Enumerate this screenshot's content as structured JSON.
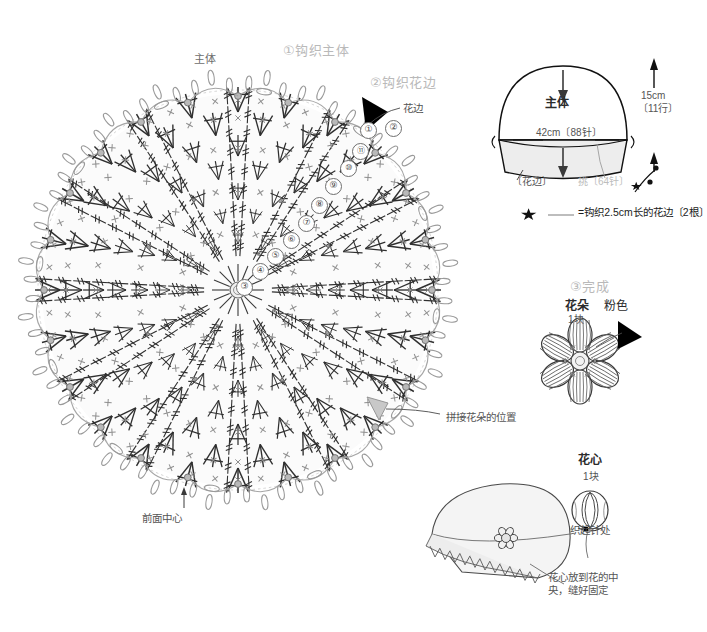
{
  "page": {
    "bg": "#ffffff"
  },
  "steps": {
    "step1": "①钩织主体",
    "step2": "②钩织花边",
    "step3": "③完成"
  },
  "main_chart": {
    "body_label": "主体",
    "lace_label": "花边",
    "front_center_label": "前面中心",
    "flower_position_label": "拼接花朵的位置",
    "round_numbers": [
      "①",
      "②",
      "⑪",
      "⑩",
      "⑨",
      "⑧",
      "⑦",
      "⑥",
      "⑤",
      "④",
      "③"
    ]
  },
  "schematic": {
    "body_label": "主体",
    "width_label": "42cm〔88针〕",
    "height_label": "15cm",
    "rows_label": "〔11行〕",
    "lace_label": "〔花边〕",
    "pickup_label": "挑〔64针〕"
  },
  "legend": {
    "star": "★",
    "text": "=钩织2.5cm长的花边〔2根〕"
  },
  "flower": {
    "name": "花朵",
    "color": "粉色",
    "count": "1块"
  },
  "flower_center": {
    "name": "花心",
    "count": "1块",
    "start_label": "编织起针处"
  },
  "finish": {
    "note_line1": "花心放到花的中",
    "note_line2": "央，缝好固定"
  },
  "colors": {
    "ink": "#3a3a3a",
    "faint": "#bdbdbd",
    "fill": "#f4f4f4",
    "accent": "#000000"
  }
}
